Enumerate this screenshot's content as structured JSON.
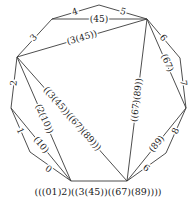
{
  "diagram": {
    "type": "polygon-triangulation",
    "vertices": {
      "A": [
        71,
        181
      ],
      "B": [
        30,
        152
      ],
      "C": [
        11,
        108
      ],
      "D": [
        17,
        57
      ],
      "E": [
        52,
        19
      ],
      "F": [
        99,
        5
      ],
      "G": [
        147,
        19
      ],
      "H": [
        180,
        58
      ],
      "I": [
        186,
        108
      ],
      "J": [
        166,
        153
      ],
      "K": [
        127,
        181
      ]
    },
    "sides": [
      {
        "label": "0"
      },
      {
        "label": "1"
      },
      {
        "label": "2"
      },
      {
        "label": "3"
      },
      {
        "label": "4"
      },
      {
        "label": "5"
      },
      {
        "label": "6"
      },
      {
        "label": "7"
      },
      {
        "label": "8"
      },
      {
        "label": "9"
      }
    ],
    "diagonals": [
      {
        "label": "(10)"
      },
      {
        "label": "(2(10))"
      },
      {
        "label": "(45)"
      },
      {
        "label": "(3(45))"
      },
      {
        "label": "(67)"
      },
      {
        "label": "(89)"
      },
      {
        "label": "((67)(89))"
      },
      {
        "label": "((3(45))((67)(89)))"
      }
    ],
    "root_label": "(((01)2)((3(45))((67)(89))))"
  }
}
